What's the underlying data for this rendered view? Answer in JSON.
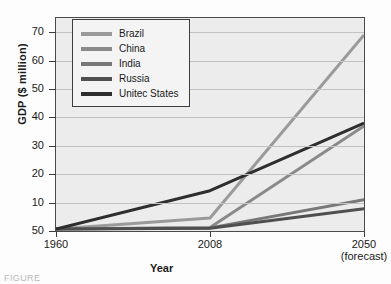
{
  "chart_data": {
    "type": "line",
    "title": "",
    "xlabel": "Year",
    "ylabel": "GDP ($ million)",
    "x": [
      "1960",
      "2008",
      "2050"
    ],
    "xtick_labels": [
      "1960",
      "2008",
      "2050"
    ],
    "xtick_sublabels": [
      "",
      "",
      "(forecast)"
    ],
    "ytick_labels": [
      "50",
      "10",
      "20",
      "30",
      "40",
      "50",
      "60",
      "70"
    ],
    "ytick_values": [
      0,
      10,
      20,
      30,
      40,
      50,
      60,
      70
    ],
    "ylim": [
      0,
      75
    ],
    "grid": true,
    "legend_position": "top-left",
    "series": [
      {
        "name": "Brazil",
        "color": "#9a9a9a",
        "values": [
          0.7,
          4.6,
          69.0
        ]
      },
      {
        "name": "China",
        "color": "#8a8a8a",
        "values": [
          0.7,
          1.2,
          37.0
        ]
      },
      {
        "name": "India",
        "color": "#787878",
        "values": [
          0.7,
          1.1,
          11.0
        ]
      },
      {
        "name": "Russia",
        "color": "#4f4f4f",
        "values": [
          0.7,
          1.0,
          7.8
        ]
      },
      {
        "name": "Unitec States",
        "color": "#2e2e2e",
        "values": [
          0.7,
          14.2,
          38.0
        ]
      }
    ]
  },
  "legend": {
    "items": [
      {
        "label": "Brazil"
      },
      {
        "label": "China"
      },
      {
        "label": "India"
      },
      {
        "label": "Russia"
      },
      {
        "label": "Unitec States"
      }
    ]
  },
  "caption": {
    "text": "FIGURE"
  }
}
